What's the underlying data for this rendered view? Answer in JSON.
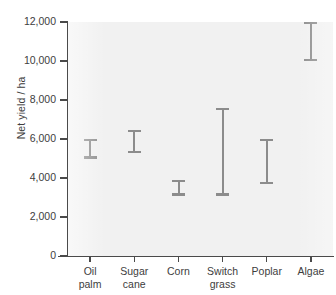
{
  "chart_data": {
    "type": "bar",
    "subtype": "range-interval",
    "title": "",
    "xlabel": "",
    "ylabel": "Net yield / ha",
    "ylim": [
      0,
      12000
    ],
    "ytick_values": [
      0,
      2000,
      4000,
      6000,
      8000,
      10000,
      12000
    ],
    "ytick_labels": [
      "0",
      "2,000",
      "4,000",
      "6,000",
      "8,000",
      "10,000",
      "12,000"
    ],
    "grid": false,
    "legend": false,
    "categories": [
      "Oil palm",
      "Sugar cane",
      "Corn",
      "Switch grass",
      "Poplar",
      "Algae"
    ],
    "category_lines": [
      [
        "Oil",
        "palm"
      ],
      [
        "Sugar",
        "cane"
      ],
      [
        "Corn"
      ],
      [
        "Switch",
        "grass"
      ],
      [
        "Poplar"
      ],
      [
        "Algae"
      ]
    ],
    "series": [
      {
        "name": "Net yield range",
        "low": [
          5000,
          5300,
          3100,
          3100,
          3700,
          10000
        ],
        "high": [
          6000,
          6450,
          3900,
          7600,
          6000,
          12000
        ]
      }
    ],
    "bar_color": "#8c8c8c",
    "plot_background": "#f1f1f1",
    "axis_color": "#4a4a4a",
    "text_color": "#3d3d3d"
  }
}
